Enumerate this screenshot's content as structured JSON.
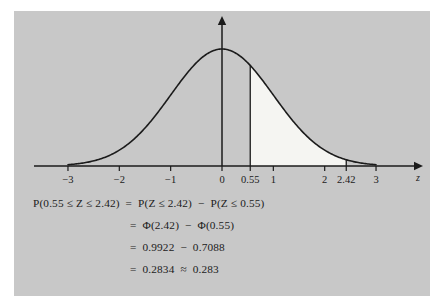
{
  "figure": {
    "panel_color": "#c8c8c8",
    "page_color": "#ffffff",
    "curve_color": "#1b1b1b",
    "shade_color": "#f5f5f2",
    "axis_label": "z"
  },
  "chart_data": {
    "type": "line",
    "title": "",
    "subtitle": "",
    "xlabel": "z",
    "ylabel": "",
    "grid": false,
    "legend": null,
    "curve_name": "standard normal density",
    "xlim": [
      -3.35,
      3.35
    ],
    "ylim": [
      0,
      0.44
    ],
    "xticks": [
      -3,
      -2,
      -1,
      0,
      0.55,
      1,
      2,
      2.42,
      3
    ],
    "xtick_labels": [
      "−3",
      "−2",
      "−1",
      "0",
      "0.55",
      "1",
      "2",
      "2.42",
      "3"
    ],
    "shaded_region": {
      "from": 0.55,
      "to": 2.42,
      "area": 0.2834,
      "fill": "#f5f5f2"
    },
    "vertical_lines": [
      0.55
    ],
    "x": [
      -3.0,
      -2.8,
      -2.6,
      -2.4,
      -2.2,
      -2.0,
      -1.8,
      -1.6,
      -1.4,
      -1.2,
      -1.0,
      -0.8,
      -0.6,
      -0.4,
      -0.2,
      0.0,
      0.2,
      0.4,
      0.6,
      0.8,
      1.0,
      1.2,
      1.4,
      1.6,
      1.8,
      2.0,
      2.2,
      2.4,
      2.6,
      2.8,
      3.0
    ],
    "y": [
      0.0044,
      0.0079,
      0.0136,
      0.0224,
      0.0355,
      0.054,
      0.079,
      0.1109,
      0.1497,
      0.1942,
      0.242,
      0.2897,
      0.3332,
      0.3683,
      0.391,
      0.3989,
      0.391,
      0.3683,
      0.3332,
      0.2897,
      0.242,
      0.1942,
      0.1497,
      0.1109,
      0.079,
      0.054,
      0.0355,
      0.0224,
      0.0136,
      0.0079,
      0.0044
    ]
  },
  "equations": {
    "line1": "P(0.55 ≤ Z ≤ 2.42)  =  P(Z ≤ 2.42)  −  P(Z ≤ 0.55)",
    "line2": "=  Φ(2.42)  −  Φ(0.55)",
    "line3": "=  0.9922  −  0.7088",
    "line4": "=  0.2834  ≈  0.283"
  }
}
